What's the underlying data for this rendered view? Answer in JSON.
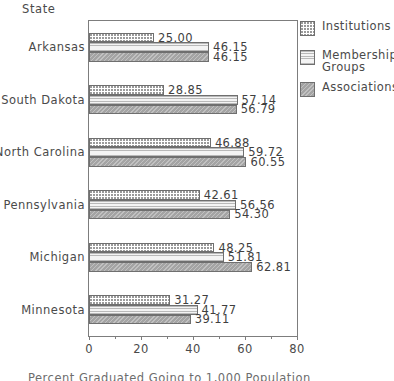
{
  "chart_data": {
    "type": "bar",
    "orientation": "horizontal",
    "grouped": true,
    "title": "",
    "ylabel": "State",
    "xlabel": "",
    "xlim": [
      0,
      80
    ],
    "xticks": [
      0,
      20,
      40,
      60,
      80
    ],
    "xtick_labels": [
      "0",
      "20",
      "40",
      "60",
      "80"
    ],
    "grid": false,
    "legend_position": "right",
    "categories": [
      "Arkansas",
      "South Dakota",
      "North Carolina",
      "Pennsylvania",
      "Michigan",
      "Minnesota"
    ],
    "series": [
      {
        "name": "Institutions",
        "pattern": "dots",
        "values": [
          25.0,
          28.85,
          46.88,
          42.61,
          48.25,
          31.27
        ],
        "labels": [
          "25.00",
          "28.85",
          "46.88",
          "42.61",
          "48.25",
          "31.27"
        ]
      },
      {
        "name": "Membership Groups",
        "pattern": "horizontal-lines",
        "values": [
          46.15,
          57.14,
          59.72,
          56.56,
          51.81,
          41.77
        ],
        "labels": [
          "46.15",
          "57.14",
          "59.72",
          "56.56",
          "51.81",
          "41.77"
        ]
      },
      {
        "name": "Associations",
        "pattern": "solid-gray",
        "values": [
          46.15,
          56.79,
          60.55,
          54.3,
          62.81,
          39.11
        ],
        "labels": [
          "46.15",
          "56.79",
          "60.55",
          "54.30",
          "62.81",
          "39.11"
        ]
      }
    ],
    "colors": {
      "axis": "#7d7d7d",
      "text": "#4a4a4a",
      "series_institutions": "#ffffff",
      "series_membership_groups": "#f0f0f0",
      "series_associations": "#a9a9a9"
    }
  },
  "legend": {
    "items": [
      {
        "label": "Institutions",
        "label_line1": "Institutions",
        "label_line2": ""
      },
      {
        "label": "Membership Groups",
        "label_line1": "Membership",
        "label_line2": "Groups"
      },
      {
        "label": "Associations",
        "label_line1": "Associations",
        "label_line2": ""
      }
    ]
  },
  "caption": {
    "text": "Percent Graduated Going to 1,000 Population"
  }
}
